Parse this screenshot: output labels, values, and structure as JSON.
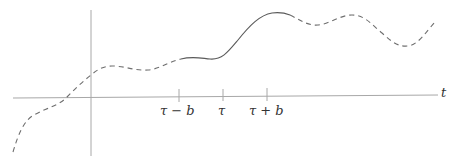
{
  "diagram": {
    "axis": {
      "horizontal_label": "t"
    },
    "ticks": [
      {
        "label": "τ − b",
        "x": 179
      },
      {
        "label": "τ",
        "x": 223
      },
      {
        "label": "τ + b",
        "x": 267
      }
    ],
    "curve": {
      "dashed_segments": [
        "left of τ − b",
        "right of τ + b"
      ],
      "solid_segment": "between τ − b and τ + b"
    }
  }
}
